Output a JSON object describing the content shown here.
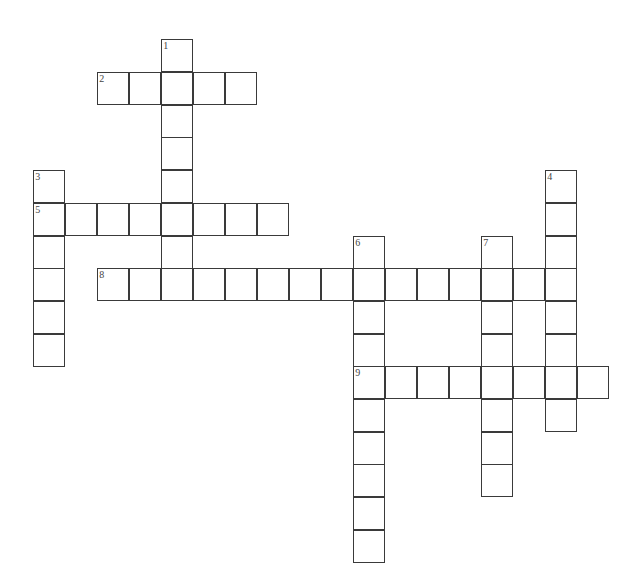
{
  "puzzle": {
    "cell_size": 32,
    "origin_x": 34,
    "origin_y": 40,
    "row_height": 32.7,
    "entries": [
      {
        "number": "1",
        "direction": "down",
        "col": 4,
        "row": 0,
        "length": 8
      },
      {
        "number": "2",
        "direction": "across",
        "col": 2,
        "row": 1,
        "length": 5
      },
      {
        "number": "3",
        "direction": "down",
        "col": 0,
        "row": 4,
        "length": 6
      },
      {
        "number": "4",
        "direction": "down",
        "col": 16,
        "row": 4,
        "length": 8
      },
      {
        "number": "5",
        "direction": "across",
        "col": 0,
        "row": 5,
        "length": 8
      },
      {
        "number": "6",
        "direction": "down",
        "col": 10,
        "row": 6,
        "length": 10
      },
      {
        "number": "7",
        "direction": "down",
        "col": 14,
        "row": 6,
        "length": 8
      },
      {
        "number": "8",
        "direction": "across",
        "col": 2,
        "row": 7,
        "length": 15
      },
      {
        "number": "9",
        "direction": "across",
        "col": 10,
        "row": 10,
        "length": 8
      }
    ]
  }
}
